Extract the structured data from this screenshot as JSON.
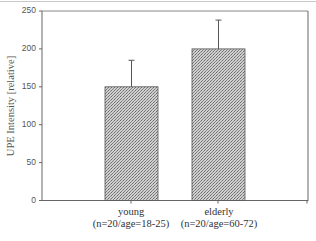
{
  "chart_data": {
    "type": "bar",
    "title": "",
    "xlabel": "",
    "ylabel": "UPE Intensity [relative]",
    "ylim": [
      0,
      250
    ],
    "yticks": [
      0,
      50,
      100,
      150,
      200,
      250
    ],
    "categories": [
      "young (n=20/age=18-25)",
      "elderly (n=20/age=60-72)"
    ],
    "category_lines": [
      [
        "young",
        "(n=20/age=18-25)"
      ],
      [
        "elderly",
        "(n=20/age=60-72)"
      ]
    ],
    "values": [
      150,
      200
    ],
    "error_upper": [
      35,
      38
    ],
    "error_bars_upper_end": [
      185,
      238
    ],
    "bar_fill": "stippled grey",
    "grid": false,
    "legend": null
  },
  "axis": {
    "ylabel": "UPE Intensity [relative]",
    "ticks": [
      "0",
      "50",
      "100",
      "150",
      "200",
      "250"
    ]
  },
  "categories": {
    "young": {
      "line1": "young",
      "line2": "(n=20/age=18-25)"
    },
    "elderly": {
      "line1": "elderly",
      "line2": "(n=20/age=60-72)"
    }
  }
}
